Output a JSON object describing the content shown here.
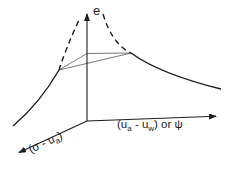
{
  "labels": {
    "vertical_axis": "e",
    "horizontal_axis": {
      "p1": "(u",
      "sub1": "a",
      "p2": " - u",
      "sub2": "w",
      "p3": ") or ψ"
    },
    "diagonal_axis": {
      "p1": "(σ - u",
      "sub1": "a",
      "p2": ")"
    }
  },
  "colors": {
    "line": "#1c1c1c",
    "background": "#ffffff"
  }
}
